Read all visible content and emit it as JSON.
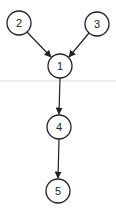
{
  "diagram": {
    "type": "directed-graph",
    "nodes": [
      {
        "id": "2",
        "label": "2",
        "cx": 19,
        "cy": 23
      },
      {
        "id": "3",
        "label": "3",
        "cx": 97,
        "cy": 24
      },
      {
        "id": "1",
        "label": "1",
        "cx": 60,
        "cy": 66
      },
      {
        "id": "4",
        "label": "4",
        "cx": 59,
        "cy": 127
      },
      {
        "id": "5",
        "label": "5",
        "cx": 58,
        "cy": 191
      }
    ],
    "edges": [
      {
        "from": "2",
        "to": "1"
      },
      {
        "from": "3",
        "to": "1"
      },
      {
        "from": "1",
        "to": "4"
      },
      {
        "from": "4",
        "to": "5"
      }
    ],
    "colors": {
      "stroke": "#222222",
      "divider": "#d8d8d8",
      "background": "#ffffff"
    }
  }
}
